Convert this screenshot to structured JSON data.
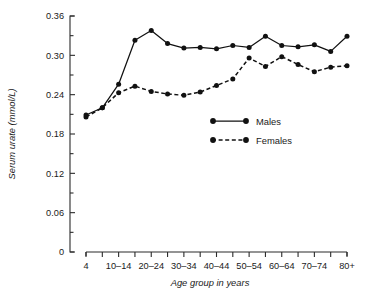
{
  "chart_data": {
    "type": "line",
    "title": "",
    "xlabel": "Age group in years",
    "ylabel": "Serum urate (mmol/L)",
    "ylim": [
      0,
      0.36
    ],
    "yticks": [
      0,
      0.06,
      0.12,
      0.18,
      0.24,
      0.3,
      0.36
    ],
    "ytick_labels": [
      "0",
      "0.06",
      "0.12",
      "0.18",
      "0.24",
      "0.30",
      "0.36"
    ],
    "grid": false,
    "legend_position": "center-right",
    "categories": [
      "4",
      "5-9",
      "10-14",
      "15-19",
      "20-24",
      "25-29",
      "30-34",
      "35-39",
      "40-44",
      "45-49",
      "50-54",
      "55-59",
      "60-64",
      "65-69",
      "70-74",
      "75-79",
      "80+"
    ],
    "xtick_labels": [
      "4",
      "",
      "10–14",
      "",
      "20–24",
      "",
      "30–34",
      "",
      "40–44",
      "",
      "50–54",
      "",
      "60–64",
      "",
      "70–74",
      "",
      "80+"
    ],
    "series": [
      {
        "name": "Males",
        "style": "solid",
        "values": [
          0.209,
          0.22,
          0.256,
          0.323,
          0.338,
          0.318,
          0.311,
          0.312,
          0.31,
          0.315,
          0.312,
          0.329,
          0.315,
          0.313,
          0.316,
          0.306,
          0.329
        ]
      },
      {
        "name": "Females",
        "style": "dashed",
        "values": [
          0.206,
          0.22,
          0.243,
          0.253,
          0.245,
          0.241,
          0.239,
          0.244,
          0.254,
          0.264,
          0.296,
          0.283,
          0.298,
          0.286,
          0.275,
          0.282,
          0.284
        ]
      }
    ],
    "colors": {
      "series": "#111111",
      "axis": "#2b2b2b",
      "background": "#ffffff"
    }
  },
  "legend": {
    "entries": [
      {
        "label": "Males"
      },
      {
        "label": "Females"
      }
    ]
  }
}
